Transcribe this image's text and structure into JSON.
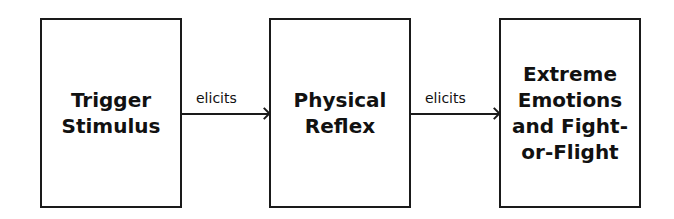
{
  "diagram": {
    "nodes": [
      {
        "id": "trigger",
        "label": "Trigger\nStimulus"
      },
      {
        "id": "reflex",
        "label": "Physical\nReflex"
      },
      {
        "id": "emotions",
        "label": "Extreme\nEmotions\nand Fight-\nor-Flight"
      }
    ],
    "edges": [
      {
        "from": "trigger",
        "to": "reflex",
        "label": "elicits"
      },
      {
        "from": "reflex",
        "to": "emotions",
        "label": "elicits"
      }
    ]
  }
}
